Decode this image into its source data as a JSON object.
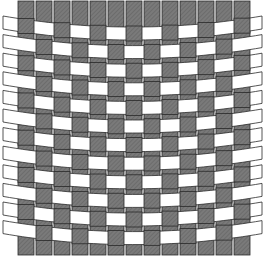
{
  "diagram": {
    "type": "plain-weave-basket",
    "width": 265,
    "height": 256,
    "colors": {
      "background": "#ffffff",
      "warp_fill": "#7a7a7a",
      "warp_hatch": "#5e5e5e",
      "weft_fill": "#ffffff",
      "outline": "#2a2a2a"
    },
    "warp": {
      "count": 13,
      "x_start": 18,
      "pitch": 18,
      "width": 16,
      "top": 1,
      "bottom": 255
    },
    "weft": {
      "count": 12,
      "edge_top_first": 16,
      "center_top_first": 27,
      "pitch": 18.6,
      "height": 13,
      "left_end": 3,
      "right_end": 262
    },
    "pattern": "over-under alternating"
  }
}
